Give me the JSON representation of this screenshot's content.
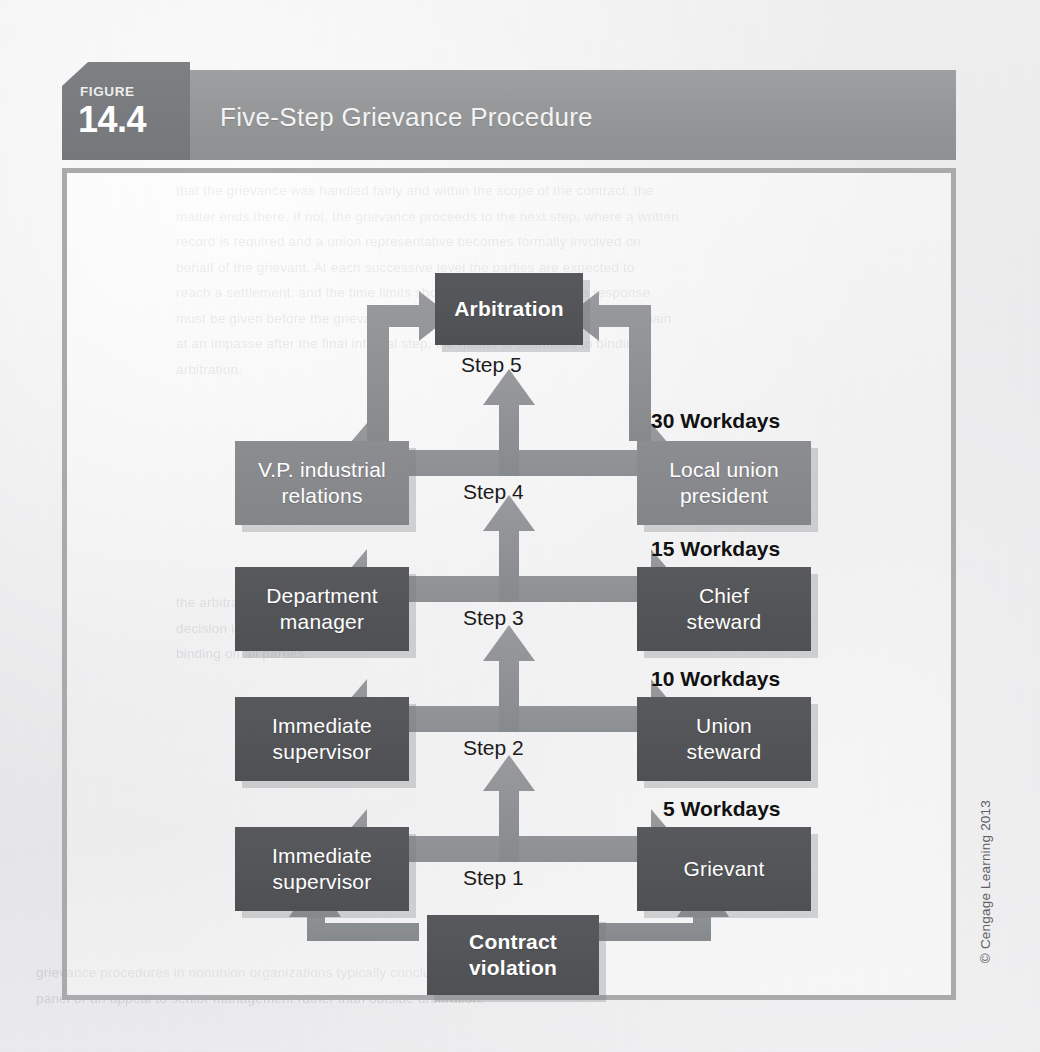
{
  "figure": {
    "tab_label": "FIGURE",
    "tab_number": "14.4",
    "title": "Five-Step Grievance Procedure"
  },
  "colors": {
    "header_bar": "#949698",
    "header_tab": "#7a7c7f",
    "node_dark": "#525457",
    "node_mid": "#87898c",
    "arrow": "#8e9093",
    "frame_border": "#a8aaac",
    "page_background": "#ececee"
  },
  "diagram": {
    "top_node": {
      "label": "Arbitration",
      "step_label": "Step 5",
      "style": "dark"
    },
    "rows": [
      {
        "step_label": "Step 4",
        "workdays": "30 Workdays",
        "left": {
          "label": "V.P. industrial\nrelations",
          "style": "mid"
        },
        "right": {
          "label": "Local union\npresident",
          "style": "mid"
        }
      },
      {
        "step_label": "Step 3",
        "workdays": "15 Workdays",
        "left": {
          "label": "Department\nmanager",
          "style": "dark"
        },
        "right": {
          "label": "Chief\nsteward",
          "style": "dark"
        }
      },
      {
        "step_label": "Step 2",
        "workdays": "10 Workdays",
        "left": {
          "label": "Immediate\nsupervisor",
          "style": "dark"
        },
        "right": {
          "label": "Union\nsteward",
          "style": "dark"
        }
      },
      {
        "step_label": "Step 1",
        "workdays": "5 Workdays",
        "left": {
          "label": "Immediate\nsupervisor",
          "style": "dark"
        },
        "right": {
          "label": "Grievant",
          "style": "dark"
        }
      }
    ],
    "bottom_node": {
      "label": "Contract\nviolation",
      "style": "dark"
    }
  },
  "credit": "© Cengage Learning 2013",
  "background_text": {
    "top": "that the grievance was handled fairly and within the scope of the contract, the\nmatter ends there. If not, the grievance proceeds to the next step, where a written\nrecord is required and a union representative becomes formally involved on\nbehalf of the grievant. At each successive level the parties are expected to\nreach a settlement, and the time limits shown govern how quickly a response\nmust be given before the grievance may be advanced. Where the parties remain\nat an impasse after the final internal step, the matter is submitted to binding\narbitration.",
    "middle": "the arbitrator whose\ndecision is final and\nbinding on all parties.",
    "right": "arbitration\nhearings are\nscheduled by",
    "bottom": "grievance procedures in nonunion organizations typically conclude with a review\npanel or an appeal to senior management rather than outside arbitration."
  }
}
